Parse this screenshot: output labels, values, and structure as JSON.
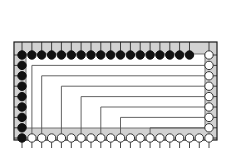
{
  "figure": {
    "type": "package-pinout-routing-diagram",
    "title": "",
    "canvas": {
      "width": 235,
      "height": 159,
      "background": "#ffffff"
    },
    "package_outline": {
      "name": "die-seal-ring",
      "x": 14,
      "y": 42,
      "width": 203,
      "height": 98,
      "fill": "#d2d2d2",
      "stroke": "#1a1a1a",
      "stroke_width": 1.2
    },
    "inner_field": {
      "name": "core-area",
      "x": 26,
      "y": 54,
      "width": 179,
      "height": 74,
      "fill": "#ffffff",
      "stroke": "#555555",
      "stroke_width": 0.8
    },
    "colors": {
      "pad_filled": "#111111",
      "pad_open_fill": "#ffffff",
      "pad_stroke": "#333333",
      "ring_fill": "#d2d2d2",
      "trace": "#555555",
      "outline": "#1a1a1a"
    },
    "pad_radius": 4.2,
    "pad_stroke_width": 1.0,
    "trace_width": 0.9,
    "counts": {
      "top_pads": 19,
      "left_pads": 8,
      "right_pads": 9,
      "bottom_pads": 19,
      "filled_pads": 27,
      "open_pads": 28,
      "routes": 7
    },
    "geometry": {
      "top_row_y": 55,
      "bottom_row_y": 138,
      "left_col_x": 22,
      "right_col_x": 209,
      "top_start_x": 22,
      "top_step": 9.85,
      "bottom_start_x": 22,
      "bottom_step": 9.85,
      "col_start_y": 55,
      "col_step": 10.4
    }
  },
  "chart_data": {
    "type": "scatter",
    "xlabel": "",
    "ylabel": "",
    "xlim": [
      0,
      235
    ],
    "ylim": [
      0,
      159
    ],
    "grid": false,
    "legend": [
      {
        "label": "driven pad (filled)",
        "marker": "filled-circle",
        "color": "#111111"
      },
      {
        "label": "sense pad (open)",
        "marker": "open-circle",
        "color": "#ffffff"
      }
    ],
    "series": [
      {
        "name": "top-pads",
        "fill": "filled",
        "note": "18 filled then 1 open at the far right corner",
        "points": [
          {
            "i": 1,
            "x": 22.0,
            "y": 55,
            "state": "filled"
          },
          {
            "i": 2,
            "x": 31.9,
            "y": 55,
            "state": "filled"
          },
          {
            "i": 3,
            "x": 41.7,
            "y": 55,
            "state": "filled"
          },
          {
            "i": 4,
            "x": 51.6,
            "y": 55,
            "state": "filled"
          },
          {
            "i": 5,
            "x": 61.4,
            "y": 55,
            "state": "filled"
          },
          {
            "i": 6,
            "x": 71.3,
            "y": 55,
            "state": "filled"
          },
          {
            "i": 7,
            "x": 81.1,
            "y": 55,
            "state": "filled"
          },
          {
            "i": 8,
            "x": 91.0,
            "y": 55,
            "state": "filled"
          },
          {
            "i": 9,
            "x": 100.8,
            "y": 55,
            "state": "filled"
          },
          {
            "i": 10,
            "x": 110.7,
            "y": 55,
            "state": "filled"
          },
          {
            "i": 11,
            "x": 120.5,
            "y": 55,
            "state": "filled"
          },
          {
            "i": 12,
            "x": 130.4,
            "y": 55,
            "state": "filled"
          },
          {
            "i": 13,
            "x": 140.2,
            "y": 55,
            "state": "filled"
          },
          {
            "i": 14,
            "x": 150.1,
            "y": 55,
            "state": "filled"
          },
          {
            "i": 15,
            "x": 159.9,
            "y": 55,
            "state": "filled"
          },
          {
            "i": 16,
            "x": 169.8,
            "y": 55,
            "state": "filled"
          },
          {
            "i": 17,
            "x": 179.6,
            "y": 55,
            "state": "filled"
          },
          {
            "i": 18,
            "x": 189.5,
            "y": 55,
            "state": "filled"
          },
          {
            "i": 19,
            "x": 209.0,
            "y": 55,
            "state": "open"
          }
        ]
      },
      {
        "name": "left-pads",
        "fill": "filled",
        "points": [
          {
            "i": 1,
            "x": 22,
            "y": 65.4,
            "state": "filled"
          },
          {
            "i": 2,
            "x": 22,
            "y": 75.8,
            "state": "filled"
          },
          {
            "i": 3,
            "x": 22,
            "y": 86.2,
            "state": "filled"
          },
          {
            "i": 4,
            "x": 22,
            "y": 96.6,
            "state": "filled"
          },
          {
            "i": 5,
            "x": 22,
            "y": 107.0,
            "state": "filled"
          },
          {
            "i": 6,
            "x": 22,
            "y": 117.4,
            "state": "filled"
          },
          {
            "i": 7,
            "x": 22,
            "y": 127.8,
            "state": "filled"
          },
          {
            "i": 8,
            "x": 22,
            "y": 138.0,
            "state": "filled"
          }
        ]
      },
      {
        "name": "right-pads",
        "fill": "open",
        "points": [
          {
            "i": 1,
            "x": 209,
            "y": 65.4,
            "state": "open"
          },
          {
            "i": 2,
            "x": 209,
            "y": 75.8,
            "state": "open"
          },
          {
            "i": 3,
            "x": 209,
            "y": 86.2,
            "state": "open"
          },
          {
            "i": 4,
            "x": 209,
            "y": 96.6,
            "state": "open"
          },
          {
            "i": 5,
            "x": 209,
            "y": 107.0,
            "state": "open"
          },
          {
            "i": 6,
            "x": 209,
            "y": 117.4,
            "state": "open"
          },
          {
            "i": 7,
            "x": 209,
            "y": 127.8,
            "state": "open"
          },
          {
            "i": 8,
            "x": 209,
            "y": 138.0,
            "state": "open"
          }
        ]
      },
      {
        "name": "bottom-pads",
        "fill": "open",
        "points": [
          {
            "i": 1,
            "x": 31.9,
            "y": 138,
            "state": "open"
          },
          {
            "i": 2,
            "x": 41.7,
            "y": 138,
            "state": "open"
          },
          {
            "i": 3,
            "x": 51.6,
            "y": 138,
            "state": "open"
          },
          {
            "i": 4,
            "x": 61.4,
            "y": 138,
            "state": "open"
          },
          {
            "i": 5,
            "x": 71.3,
            "y": 138,
            "state": "open"
          },
          {
            "i": 6,
            "x": 81.1,
            "y": 138,
            "state": "open"
          },
          {
            "i": 7,
            "x": 91.0,
            "y": 138,
            "state": "open"
          },
          {
            "i": 8,
            "x": 100.8,
            "y": 138,
            "state": "open"
          },
          {
            "i": 9,
            "x": 110.7,
            "y": 138,
            "state": "open"
          },
          {
            "i": 10,
            "x": 120.5,
            "y": 138,
            "state": "open"
          },
          {
            "i": 11,
            "x": 130.4,
            "y": 138,
            "state": "open"
          },
          {
            "i": 12,
            "x": 140.2,
            "y": 138,
            "state": "open"
          },
          {
            "i": 13,
            "x": 150.1,
            "y": 138,
            "state": "open"
          },
          {
            "i": 14,
            "x": 159.9,
            "y": 138,
            "state": "open"
          },
          {
            "i": 15,
            "x": 169.8,
            "y": 138,
            "state": "open"
          },
          {
            "i": 16,
            "x": 179.6,
            "y": 138,
            "state": "open"
          },
          {
            "i": 17,
            "x": 189.5,
            "y": 138,
            "state": "open"
          },
          {
            "i": 18,
            "x": 199.3,
            "y": 138,
            "state": "open"
          }
        ]
      }
    ],
    "routes": [
      {
        "i": 1,
        "from_x": 31.9,
        "from_y": 138,
        "corner_y": 65.4,
        "to_x": 209,
        "to_y": 65.4
      },
      {
        "i": 2,
        "from_x": 41.7,
        "from_y": 138,
        "corner_y": 75.8,
        "to_x": 209,
        "to_y": 75.8
      },
      {
        "i": 3,
        "from_x": 61.4,
        "from_y": 138,
        "corner_y": 86.2,
        "to_x": 209,
        "to_y": 86.2
      },
      {
        "i": 4,
        "from_x": 81.1,
        "from_y": 138,
        "corner_y": 96.6,
        "to_x": 209,
        "to_y": 96.6
      },
      {
        "i": 5,
        "from_x": 100.8,
        "from_y": 138,
        "corner_y": 107.0,
        "to_x": 209,
        "to_y": 107.0
      },
      {
        "i": 6,
        "from_x": 120.5,
        "from_y": 138,
        "corner_y": 117.4,
        "to_x": 209,
        "to_y": 117.4
      },
      {
        "i": 7,
        "from_x": 150.1,
        "from_y": 138,
        "corner_y": 127.8,
        "to_x": 209,
        "to_y": 127.8
      }
    ],
    "ring_ticks": {
      "note": "short radial stubs crossing the gray seal ring at every pad",
      "top_inner_y": 42,
      "bottom_outer_y": 148,
      "left_outer_x": 14,
      "right_outer_x": 217
    }
  }
}
